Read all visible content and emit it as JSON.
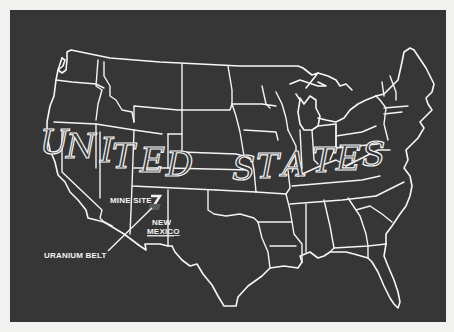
{
  "map": {
    "title_word_1": "UNITED",
    "title_word_2": "STATES",
    "title_letters_1": [
      "U",
      "N",
      "I",
      "T",
      "E",
      "D"
    ],
    "title_letters_2": [
      "S",
      "T",
      "A",
      "T",
      "E",
      "S"
    ],
    "labels": {
      "mine_site": "MINE SITE",
      "state_line_1": "NEW",
      "state_line_2": "MEXICO",
      "uranium_belt": "URANIUM BELT"
    },
    "colors": {
      "background": "#363636",
      "lines": "#f4f4f4",
      "paper": "#f1f1ef"
    }
  }
}
